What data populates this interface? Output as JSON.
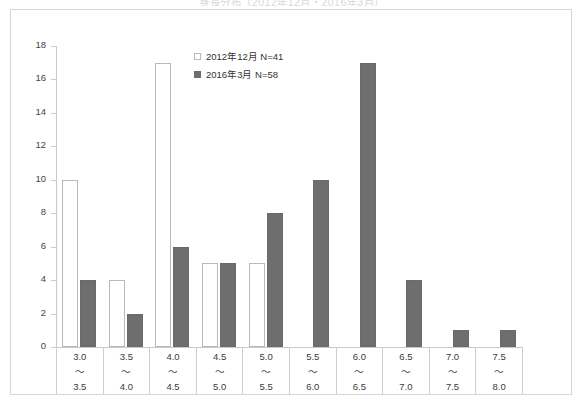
{
  "chart_title_faint": "身長分布（2012年12月・2016年3月）",
  "legend": {
    "position": "inside-top-center",
    "items": [
      {
        "swatch": "open-square-icon",
        "label": "2012年12月 N=41"
      },
      {
        "swatch": "filled-square-icon",
        "label": "2016年3月 N=58"
      }
    ]
  },
  "axes": {
    "y_ticks": [
      "0",
      "2",
      "4",
      "6",
      "8",
      "10",
      "12",
      "14",
      "16",
      "18"
    ]
  },
  "colors": {
    "series_a_fill": "#ffffff",
    "series_a_border": "#b9b9b9",
    "series_b_fill": "#6e6e6e",
    "series_b_border": "#6a6a6a",
    "axis": "#c9c9c9",
    "frame": "#d6d6d6",
    "text": "#3a3a3a"
  },
  "chart_data": {
    "type": "bar",
    "title": "",
    "xlabel": "",
    "ylabel": "",
    "ylim": [
      0,
      18
    ],
    "ytick_step": 2,
    "grid": false,
    "legend_position": "inside-top-center",
    "categories": [
      "3.0～3.5",
      "3.5～4.0",
      "4.0～4.5",
      "4.5～5.0",
      "5.0～5.5",
      "5.5～6.0",
      "6.0～6.5",
      "6.5～7.0",
      "7.0～7.5",
      "7.5～8.0"
    ],
    "category_bounds": [
      {
        "lo": "3.0",
        "sep": "～",
        "hi": "3.5"
      },
      {
        "lo": "3.5",
        "sep": "～",
        "hi": "4.0"
      },
      {
        "lo": "4.0",
        "sep": "～",
        "hi": "4.5"
      },
      {
        "lo": "4.5",
        "sep": "～",
        "hi": "5.0"
      },
      {
        "lo": "5.0",
        "sep": "～",
        "hi": "5.5"
      },
      {
        "lo": "5.5",
        "sep": "～",
        "hi": "6.0"
      },
      {
        "lo": "6.0",
        "sep": "～",
        "hi": "6.5"
      },
      {
        "lo": "6.5",
        "sep": "～",
        "hi": "7.0"
      },
      {
        "lo": "7.0",
        "sep": "～",
        "hi": "7.5"
      },
      {
        "lo": "7.5",
        "sep": "～",
        "hi": "8.0"
      }
    ],
    "series": [
      {
        "name": "2012年12月 N=41",
        "values": [
          10,
          4,
          17,
          5,
          5,
          0,
          0,
          0,
          0,
          0
        ]
      },
      {
        "name": "2016年3月 N=58",
        "values": [
          4,
          2,
          6,
          5,
          8,
          10,
          17,
          4,
          1,
          1
        ]
      }
    ]
  }
}
